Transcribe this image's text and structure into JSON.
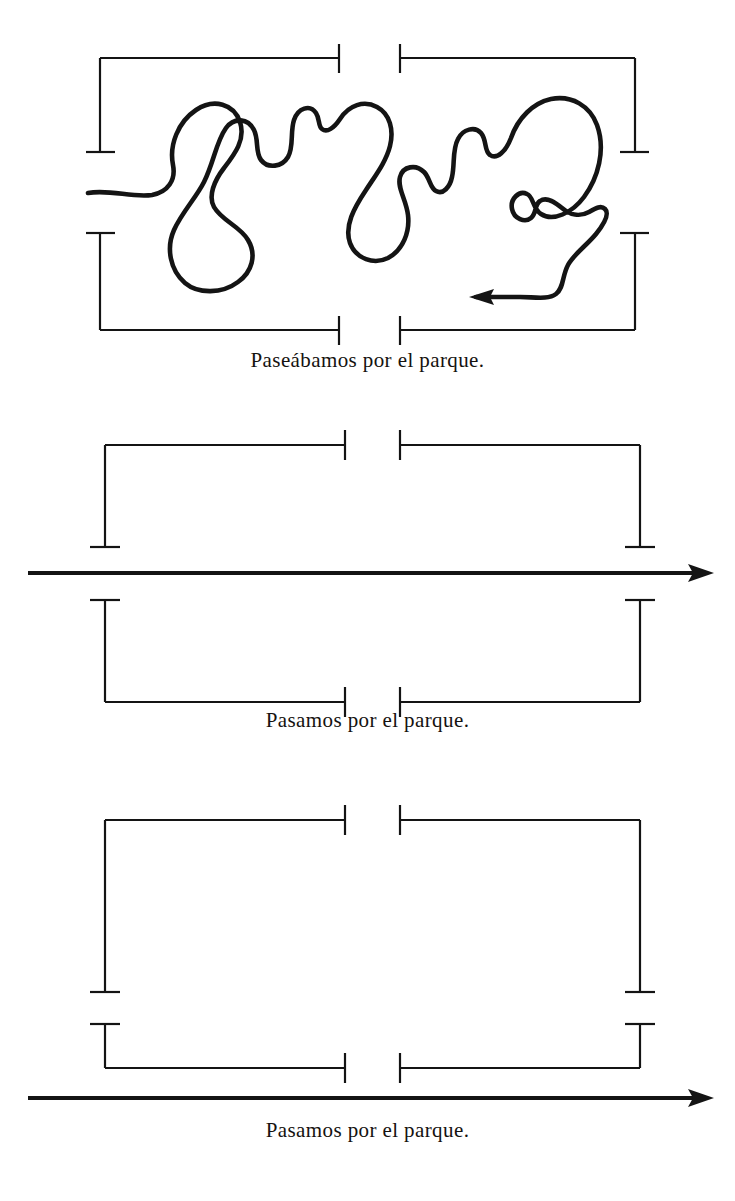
{
  "document": {
    "type": "linguistic-aspect-diagram",
    "language": "Spanish",
    "background_color": "#ffffff",
    "ink_color": "#141414"
  },
  "panels": [
    {
      "id": "panel-imperfect",
      "caption": "Paseábamos por el parque.",
      "bracket_style": "full-box-split",
      "timeline": "none",
      "scribble": {
        "present": true,
        "description": "wandering looped line inside the bracket",
        "arrowhead_direction": "left",
        "arrowhead_x": 472,
        "arrowhead_y": 297,
        "start_x": 88,
        "start_y": 193
      }
    },
    {
      "id": "panel-preterite-upper",
      "caption": "Pasamos por el parque.",
      "bracket_style": "split-open-brackets",
      "timeline": "between-brackets",
      "scribble": {
        "present": false
      }
    },
    {
      "id": "panel-preterite-lower",
      "caption": "Pasamos por el parque.",
      "bracket_style": "split-open-brackets",
      "timeline": "below-brackets",
      "scribble": {
        "present": false
      }
    }
  ],
  "timelines": [
    {
      "id": "timeline-1",
      "y": 573,
      "x_start": 28,
      "x_end": 714,
      "arrow_direction": "right"
    },
    {
      "id": "timeline-2",
      "y": 1098,
      "x_start": 28,
      "x_end": 714,
      "arrow_direction": "right"
    }
  ],
  "captions": {
    "first": "Paseábamos por el parque.",
    "second": "Pasamos por el parque.",
    "third": "Pasamos por el parque."
  }
}
